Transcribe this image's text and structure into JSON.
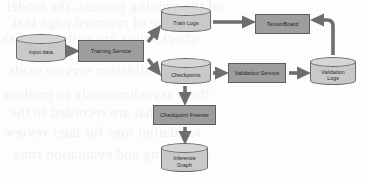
{
  "diagram": {
    "colors": {
      "process_fill": "#9d9d9d",
      "process_stroke": "#5e5e5e",
      "datastore_fill": "#c9c9c9",
      "datastore_top": "#d6d6d6",
      "datastore_stroke": "#6a6a6a",
      "arrow": "#6e6e6e",
      "page_background": "#fdfdfd"
    },
    "nodes": [
      {
        "id": "input-data",
        "label": "Input data",
        "shape": "cylinder",
        "x": 16,
        "y": 34,
        "w": 50,
        "h": 28
      },
      {
        "id": "training-service",
        "label": "Training Service",
        "shape": "box",
        "x": 78,
        "y": 40,
        "w": 66,
        "h": 22
      },
      {
        "id": "train-logs",
        "label": "Train Logs",
        "shape": "cylinder",
        "x": 161,
        "y": 6,
        "w": 50,
        "h": 26
      },
      {
        "id": "checkpoints",
        "label": "Checkpoints",
        "shape": "cylinder",
        "x": 161,
        "y": 58,
        "w": 50,
        "h": 26
      },
      {
        "id": "tensorboard",
        "label": "TensorBoard",
        "shape": "box",
        "x": 255,
        "y": 14,
        "w": 55,
        "h": 20
      },
      {
        "id": "validation-service",
        "label": "Validation Service",
        "shape": "box",
        "x": 228,
        "y": 63,
        "w": 58,
        "h": 20
      },
      {
        "id": "validation-logs",
        "label": "Validation\nLogs",
        "shape": "cylinder",
        "x": 310,
        "y": 57,
        "w": 46,
        "h": 28
      },
      {
        "id": "checkpoint-freezer",
        "label": "Checkpoint Freezer",
        "shape": "box",
        "x": 153,
        "y": 105,
        "w": 63,
        "h": 20
      },
      {
        "id": "inference-graph",
        "label": "Inference\nGraph",
        "shape": "cylinder",
        "x": 161,
        "y": 143,
        "w": 47,
        "h": 29
      }
    ],
    "edges": [
      {
        "from": "input-data",
        "to": "training-service",
        "style": "straight-right"
      },
      {
        "from": "training-service",
        "to": "train-logs",
        "style": "diagonal-up-right"
      },
      {
        "from": "training-service",
        "to": "checkpoints",
        "style": "diagonal-down-right"
      },
      {
        "from": "train-logs",
        "to": "tensorboard",
        "style": "straight-right"
      },
      {
        "from": "checkpoints",
        "to": "validation-service",
        "style": "straight-right"
      },
      {
        "from": "validation-service",
        "to": "validation-logs",
        "style": "straight-right"
      },
      {
        "from": "validation-logs",
        "to": "tensorboard",
        "style": "curved-up-left"
      },
      {
        "from": "checkpoints",
        "to": "checkpoint-freezer",
        "style": "straight-down"
      },
      {
        "from": "checkpoint-freezer",
        "to": "inference-graph",
        "style": "straight-down"
      }
    ]
  },
  "background_text": {
    "note": "faint bleed-through text from reverse side of scanned page",
    "lines": [
      "of the training process, the model",
      "ghost line of reversed page text",
      "checkpoints are written to disk",
      "and the validation service reads",
      "them asynchronously to produce",
      "metrics that are recorded in the",
      "validation logs for later review",
      "of training and evaluation runs"
    ]
  }
}
